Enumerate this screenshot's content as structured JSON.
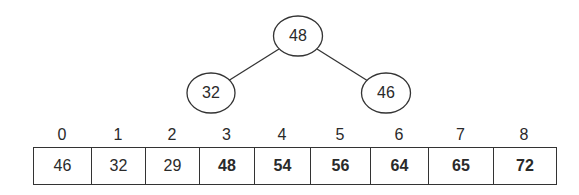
{
  "tree": {
    "nodes": [
      {
        "id": "root",
        "value": "48",
        "cx": 298,
        "cy": 36
      },
      {
        "id": "left",
        "value": "32",
        "cx": 211,
        "cy": 93
      },
      {
        "id": "right",
        "value": "46",
        "cx": 386,
        "cy": 93
      }
    ],
    "edges": [
      {
        "from": "root",
        "to": "left"
      },
      {
        "from": "root",
        "to": "right"
      }
    ]
  },
  "array": {
    "indices": [
      "0",
      "1",
      "2",
      "3",
      "4",
      "5",
      "6",
      "7",
      "8"
    ],
    "cells": [
      {
        "value": "46",
        "bold": false,
        "width": 58
      },
      {
        "value": "32",
        "bold": false,
        "width": 54
      },
      {
        "value": "29",
        "bold": false,
        "width": 54
      },
      {
        "value": "48",
        "bold": true,
        "width": 55
      },
      {
        "value": "54",
        "bold": true,
        "width": 56
      },
      {
        "value": "56",
        "bold": true,
        "width": 60
      },
      {
        "value": "64",
        "bold": true,
        "width": 58
      },
      {
        "value": "65",
        "bold": true,
        "width": 65
      },
      {
        "value": "72",
        "bold": true,
        "width": 62
      }
    ]
  },
  "colors": {
    "stroke": "#333333",
    "text": "#2a2a2a",
    "background": "#ffffff"
  }
}
